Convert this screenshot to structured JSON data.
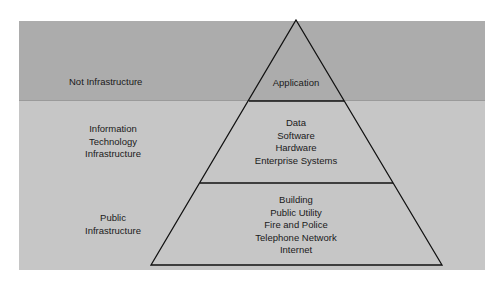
{
  "diagram": {
    "type": "pyramid",
    "colors": {
      "top_band": "#acacac",
      "lower_band": "#c6c6c6",
      "lines": "#111111"
    },
    "side_labels": {
      "not_infrastructure": [
        "Not Infrastructure"
      ],
      "it_infrastructure": [
        "Information",
        "Technology",
        "Infrastructure"
      ],
      "public_infrastructure": [
        "Public",
        "Infrastructure"
      ]
    },
    "tiers": {
      "top": [
        "Application"
      ],
      "middle": [
        "Data",
        "Software",
        "Hardware",
        "Enterprise Systems"
      ],
      "bottom": [
        "Building",
        "Public Utility",
        "Fire and Police",
        "Telephone Network",
        "Internet"
      ]
    }
  }
}
